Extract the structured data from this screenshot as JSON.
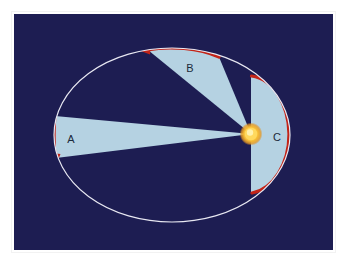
{
  "figure": {
    "panel": {
      "background_color": "#1d1d52",
      "frame_color": "#ffffff",
      "outer_background": "#ffffff",
      "x": 14,
      "y": 14,
      "width": 319,
      "height": 236
    },
    "orbit": {
      "name": "elliptical-orbit",
      "stroke_color": "#e8e8f2",
      "center_x": 172,
      "center_y": 135,
      "radius_x": 118,
      "radius_y": 87
    },
    "star": {
      "name": "sun",
      "center_x": 251,
      "center_y": 134,
      "core_radius": 6,
      "glow_radius": 11,
      "core_color": "#ffe98a",
      "mid_color": "#f6c13a",
      "edge_color": "#e8961f"
    },
    "sector_fill_color": "#b5d2e2",
    "arc_highlight_color": "#c22418",
    "arc_arrow_color": "#c22418",
    "sectors": [
      {
        "id": "A",
        "label": "A",
        "label_x": 71,
        "label_y": 140,
        "description": "Swept area near aphelion, wide and far from the star"
      },
      {
        "id": "B",
        "label": "B",
        "label_x": 190,
        "label_y": 69,
        "description": "Swept area at intermediate distance, upper portion of orbit"
      },
      {
        "id": "C",
        "label": "C",
        "label_x": 277,
        "label_y": 138,
        "description": "Swept area near perihelion, narrow angle but close to the star"
      }
    ],
    "arcs": [
      {
        "id": "arc-A",
        "label": "aphelion arc",
        "has_arrowhead": true
      },
      {
        "id": "arc-B",
        "label": "intermediate arc",
        "has_arrowhead": true
      },
      {
        "id": "arc-C",
        "label": "perihelion arc",
        "has_arrowhead": false
      }
    ]
  }
}
